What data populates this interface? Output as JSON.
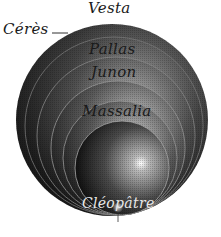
{
  "figure": {
    "type": "asteroid-size-comparison-engraving",
    "labels": {
      "vesta": "Vesta",
      "ceres": "Cérès",
      "pallas": "Pallas",
      "junon": "Junon",
      "massalia": "Massalia",
      "cleopatre": "Cléopâtre"
    },
    "bodies": [
      {
        "name": "Cérès",
        "cx": 112,
        "cy": 120,
        "r": 96
      },
      {
        "name": "Vesta",
        "cx": 114,
        "cy": 126,
        "r": 89
      },
      {
        "name": "Pallas",
        "cx": 116,
        "cy": 136,
        "r": 79
      },
      {
        "name": "Junon",
        "cx": 118,
        "cy": 148,
        "r": 67
      },
      {
        "name": "ring",
        "cx": 120,
        "cy": 158,
        "r": 57
      },
      {
        "name": "Massalia",
        "cx": 122,
        "cy": 168,
        "r": 47
      },
      {
        "name": "Cléopâtre",
        "cx": 118,
        "cy": 208,
        "r": 5
      }
    ],
    "colors": {
      "background": "#ffffff",
      "ink": "#1a1a1a",
      "highlight": "#e8e8e8"
    }
  }
}
